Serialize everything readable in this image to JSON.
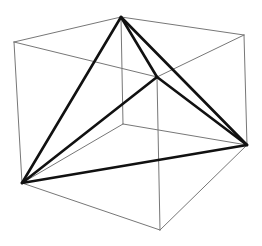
{
  "diagram": {
    "colors": {
      "cube_edge": "#777777",
      "tetra_edge": "#111111",
      "background": "#ffffff"
    },
    "vertices": {
      "A": [
        14,
        42
      ],
      "B": [
        121,
        17
      ],
      "C": [
        244,
        35
      ],
      "D": [
        157,
        77
      ],
      "E": [
        22,
        183
      ],
      "F": [
        123,
        124
      ],
      "G": [
        247,
        145
      ],
      "H": [
        160,
        230
      ]
    },
    "cube_edges": [
      [
        "A",
        "B"
      ],
      [
        "B",
        "C"
      ],
      [
        "C",
        "D"
      ],
      [
        "D",
        "A"
      ],
      [
        "E",
        "F"
      ],
      [
        "F",
        "G"
      ],
      [
        "G",
        "H"
      ],
      [
        "H",
        "E"
      ],
      [
        "A",
        "E"
      ],
      [
        "B",
        "F"
      ],
      [
        "C",
        "G"
      ],
      [
        "D",
        "H"
      ]
    ],
    "tetrahedron_edges": [
      [
        "B",
        "D"
      ],
      [
        "B",
        "E"
      ],
      [
        "B",
        "G"
      ],
      [
        "D",
        "E"
      ],
      [
        "D",
        "G"
      ],
      [
        "E",
        "G"
      ]
    ]
  }
}
